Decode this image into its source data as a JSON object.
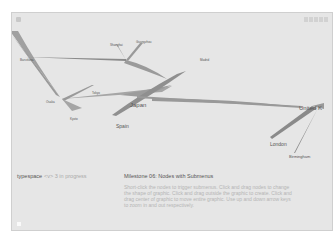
{
  "app": {
    "title": "typespace",
    "subtitle": "<v> 3 in progress"
  },
  "toolbar": {
    "buttons": [
      "btn-1",
      "btn-2",
      "btn-3",
      "btn-4",
      "btn-5"
    ]
  },
  "milestone": {
    "title": "Milestone 06: Nodes with Submenus",
    "description": "Short-click the nodes to trigger submenus. Click and drag nodes to change the shape of graphic. Click and drag outside the graphic to create. Click and drag center of graphic to move entire graphic. Use up and down arrow keys to zoom in and out respectively."
  },
  "graph": {
    "nodes": [
      {
        "id": "japan",
        "label": "Japan",
        "x": 121,
        "y": 94
      },
      {
        "id": "spain",
        "label": "Spain",
        "x": 107,
        "y": 113
      },
      {
        "id": "united_kingdom",
        "label": "United K",
        "x": 300,
        "y": 95
      },
      {
        "id": "london",
        "label": "London",
        "x": 268,
        "y": 130
      },
      {
        "id": "birmingham",
        "label": "Birmingham",
        "x": 288,
        "y": 145
      },
      {
        "id": "n_hub_left",
        "label": "",
        "x": 57,
        "y": 95
      },
      {
        "id": "n_hub_top",
        "label": "",
        "x": 125,
        "y": 58
      },
      {
        "id": "n_top_a",
        "label": "Shanghai",
        "x": 112,
        "y": 33
      },
      {
        "id": "n_top_b",
        "label": "Guangzhou",
        "x": 136,
        "y": 30
      },
      {
        "id": "n_left_top",
        "label": "Barcelona",
        "x": 22,
        "y": 46
      },
      {
        "id": "n_mid_a",
        "label": "Tokyo",
        "x": 85,
        "y": 81
      },
      {
        "id": "n_mid_b",
        "label": "Osaka",
        "x": 40,
        "y": 88
      },
      {
        "id": "n_mid_c",
        "label": "Kyoto",
        "x": 62,
        "y": 110
      },
      {
        "id": "n_right_top",
        "label": "Madrid",
        "x": 196,
        "y": 47
      }
    ],
    "labels": {
      "japan": "Japan",
      "spain": "Spain",
      "uk": "United K",
      "london": "London",
      "birmingham": "Birmingham"
    }
  }
}
